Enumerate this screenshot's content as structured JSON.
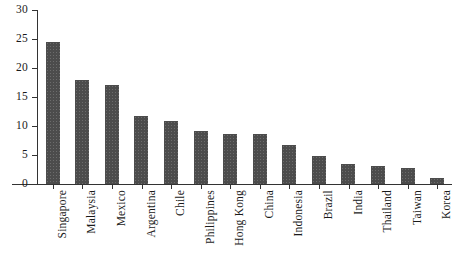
{
  "chart_data": {
    "type": "bar",
    "title": "",
    "subtitle": "",
    "xlabel": "",
    "ylabel": "",
    "ylim": [
      0,
      30
    ],
    "yticks": [
      0,
      5,
      10,
      15,
      20,
      25,
      30
    ],
    "grid": false,
    "legend": null,
    "bar_color": "#4c4c4c",
    "axis_color": "#333333",
    "background": "#ffffff",
    "categories": [
      "Singapore",
      "Malaysia",
      "Mexico",
      "Argentina",
      "Chile",
      "Philippines",
      "Hong Kong",
      "China",
      "Indonesia",
      "Brazil",
      "India",
      "Thailand",
      "Taiwan",
      "Korea"
    ],
    "values": [
      24.4,
      17.9,
      17.0,
      11.8,
      10.8,
      9.1,
      8.6,
      8.6,
      6.7,
      4.9,
      3.5,
      3.1,
      2.8,
      1.1
    ]
  }
}
